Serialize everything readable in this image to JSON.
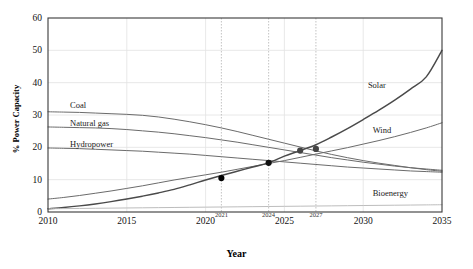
{
  "chart_data": {
    "type": "line",
    "title": "",
    "xlabel": "Year",
    "ylabel": "% Power Capacity",
    "xlim": [
      2010,
      2035
    ],
    "ylim": [
      0,
      60
    ],
    "grid": true,
    "legend_position": "inline-labels",
    "xticks": [
      "2010",
      "2015",
      "2020",
      "2025",
      "2030",
      "2035"
    ],
    "xtick_values": [
      2010,
      2015,
      2020,
      2025,
      2030,
      2035
    ],
    "yticks": [
      "0",
      "10",
      "20",
      "30",
      "40",
      "50",
      "60"
    ],
    "ytick_values": [
      0,
      10,
      20,
      30,
      40,
      50,
      60
    ],
    "annotation_xticks": [
      "2021",
      "2024",
      "2027"
    ],
    "annotation_xtick_values": [
      2021,
      2024,
      2027
    ],
    "x": [
      2010,
      2011,
      2012,
      2013,
      2014,
      2015,
      2016,
      2017,
      2018,
      2019,
      2020,
      2021,
      2022,
      2023,
      2024,
      2025,
      2026,
      2027,
      2028,
      2029,
      2030,
      2031,
      2032,
      2033,
      2034,
      2035
    ],
    "series": [
      {
        "name": "Coal",
        "label": "Coal",
        "color": "#6b6b6b",
        "values": [
          31.0,
          30.9,
          30.8,
          30.6,
          30.4,
          30.2,
          29.9,
          29.4,
          28.7,
          27.9,
          27.0,
          26.0,
          24.9,
          23.7,
          22.5,
          21.3,
          20.1,
          18.9,
          17.8,
          16.8,
          15.9,
          15.1,
          14.4,
          13.7,
          13.1,
          12.6
        ]
      },
      {
        "name": "Natural gas",
        "label": "Natural gas",
        "color": "#6b6b6b",
        "values": [
          26.3,
          26.2,
          26.1,
          26.0,
          25.8,
          25.5,
          25.1,
          24.7,
          24.2,
          23.6,
          23.0,
          22.3,
          21.6,
          20.8,
          20.0,
          19.2,
          18.4,
          17.6,
          16.8,
          16.1,
          15.4,
          14.8,
          14.2,
          13.7,
          13.3,
          12.9
        ]
      },
      {
        "name": "Hydropower",
        "label": "Hydropower",
        "color": "#6b6b6b",
        "values": [
          19.8,
          19.7,
          19.6,
          19.4,
          19.2,
          19.0,
          18.8,
          18.5,
          18.2,
          17.9,
          17.5,
          17.1,
          16.7,
          16.3,
          15.9,
          15.5,
          15.1,
          14.7,
          14.3,
          13.9,
          13.6,
          13.3,
          13.0,
          12.7,
          12.5,
          12.3
        ]
      },
      {
        "name": "Wind",
        "label": "Wind",
        "color": "#6b6b6b",
        "values": [
          4.0,
          4.5,
          5.1,
          5.8,
          6.5,
          7.3,
          8.1,
          9.0,
          9.9,
          10.7,
          11.5,
          12.3,
          13.2,
          14.1,
          15.0,
          15.9,
          16.9,
          17.9,
          18.9,
          19.9,
          21.0,
          22.1,
          23.3,
          24.6,
          26.0,
          27.6
        ]
      },
      {
        "name": "Solar",
        "label": "Solar",
        "color": "#4a4a4a",
        "values": [
          1.0,
          1.4,
          1.9,
          2.5,
          3.2,
          4.0,
          4.9,
          5.9,
          7.0,
          8.4,
          9.9,
          11.3,
          12.6,
          13.9,
          15.2,
          17.3,
          19.0,
          20.8,
          23.2,
          25.8,
          28.6,
          31.5,
          34.6,
          38.0,
          41.8,
          50.0
        ]
      },
      {
        "name": "Bioenergy",
        "label": "Bioenergy",
        "color": "#bdbdbd",
        "values": [
          1.0,
          1.05,
          1.1,
          1.15,
          1.2,
          1.25,
          1.3,
          1.35,
          1.4,
          1.45,
          1.5,
          1.55,
          1.6,
          1.65,
          1.7,
          1.75,
          1.8,
          1.85,
          1.9,
          1.95,
          2.0,
          2.05,
          2.1,
          2.15,
          2.2,
          2.25
        ]
      }
    ],
    "markers": [
      {
        "x": 2021,
        "y": 10.5,
        "series": "Solar",
        "color": "#000000"
      },
      {
        "x": 2024,
        "y": 15.2,
        "series": "Solar",
        "color": "#111111"
      },
      {
        "x": 2026,
        "y": 19.0,
        "series": "Solar",
        "color": "#444444"
      },
      {
        "x": 2027,
        "y": 19.5,
        "series": "Solar",
        "color": "#444444"
      }
    ],
    "annotations": [
      {
        "text": "Coal",
        "x": 2011.4,
        "y": 33.0
      },
      {
        "text": "Natural gas",
        "x": 2011.4,
        "y": 27.4
      },
      {
        "text": "Hydropower",
        "x": 2011.4,
        "y": 21.0
      },
      {
        "text": "Solar",
        "x": 2030.3,
        "y": 39.3
      },
      {
        "text": "Wind",
        "x": 2030.6,
        "y": 25.5
      },
      {
        "text": "Bioenergy",
        "x": 2030.6,
        "y": 6.0
      }
    ]
  }
}
